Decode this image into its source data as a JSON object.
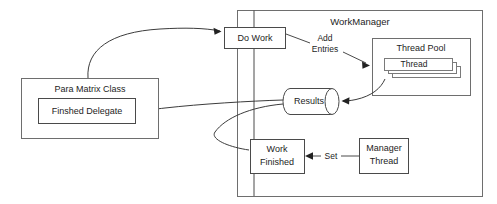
{
  "diagram": {
    "type": "block-flow-diagram",
    "canvas": {
      "width": 497,
      "height": 204
    },
    "colors": {
      "background": "#ffffff",
      "box_stroke": "#6e6e6e",
      "box_stroke_dark": "#4a4a4a",
      "connector": "#4a4a4a",
      "arrow_fill": "#222222",
      "text": "#1d1d1d"
    },
    "containers": {
      "work_manager": {
        "label": "WorkManager",
        "x": 237,
        "y": 10,
        "width": 245,
        "height": 186,
        "label_x": 360,
        "label_y": 22
      },
      "para_matrix_class": {
        "label": "Para Matrix Class",
        "x": 21,
        "y": 78,
        "width": 137,
        "height": 60,
        "label_x": 90,
        "label_y": 90
      },
      "thread_pool": {
        "label": "Thread Pool",
        "x": 372,
        "y": 38,
        "width": 98,
        "height": 58,
        "label_x": 421,
        "label_y": 49
      }
    },
    "nodes": {
      "do_work": {
        "label": "Do Work",
        "x": 224,
        "y": 27,
        "width": 61,
        "height": 21,
        "label_x": 254,
        "label_y": 38
      },
      "finshed_delegate": {
        "label": "Finshed Delegate",
        "x": 38,
        "y": 98,
        "width": 97,
        "height": 25,
        "label_x": 86,
        "label_y": 111
      },
      "results": {
        "label": "Results",
        "x": 281,
        "y": 88,
        "width": 60,
        "height": 26,
        "label_x": 308,
        "label_y": 101
      },
      "work_finished": {
        "label_line1": "Work",
        "label_line2": "Finished",
        "x": 250,
        "y": 139,
        "width": 54,
        "height": 34,
        "label_x": 277,
        "label_y": 149
      },
      "manager_thread": {
        "label_line1": "Manager",
        "label_line2": "Thread",
        "x": 359,
        "y": 138,
        "width": 49,
        "height": 35,
        "label_x": 383,
        "label_y": 148
      },
      "thread_stack": {
        "label": "Thread",
        "label_x": 412,
        "label_y": 66,
        "layers": [
          {
            "x": 392,
            "y": 66,
            "width": 70,
            "height": 12
          },
          {
            "x": 388,
            "y": 62,
            "width": 70,
            "height": 12
          },
          {
            "x": 384,
            "y": 58,
            "width": 70,
            "height": 13
          }
        ]
      }
    },
    "edge_labels": [
      {
        "name": "add-entries",
        "line1": "Add",
        "line2": "Entries",
        "x": 325,
        "y": 44
      },
      {
        "name": "set",
        "text": "Set",
        "x": 331,
        "y": 156
      }
    ],
    "connectors": [
      {
        "name": "do-work-to-para-matrix",
        "from": "do_work",
        "to": "para_matrix_class",
        "kind": "curve",
        "arrow": "at-do-work"
      },
      {
        "name": "do-work-to-add-entries",
        "from": "do_work",
        "to": "add_entries_label",
        "kind": "line"
      },
      {
        "name": "add-entries-to-thread-pool",
        "from": "add_entries_label",
        "to": "thread_pool",
        "kind": "line",
        "arrow": "at-thread-pool"
      },
      {
        "name": "thread-pool-to-results",
        "from": "thread_pool",
        "to": "results",
        "kind": "curve",
        "arrow": "at-results"
      },
      {
        "name": "results-to-finshed-delegate",
        "from": "results",
        "to": "finshed_delegate",
        "kind": "curve",
        "arrow": "at-finshed-delegate"
      },
      {
        "name": "results-to-work-finished",
        "from": "results",
        "to": "work_finished",
        "kind": "curve"
      },
      {
        "name": "manager-thread-to-work-finished",
        "from": "manager_thread",
        "to": "work_finished",
        "kind": "line",
        "arrow": "at-work-finished"
      }
    ]
  }
}
